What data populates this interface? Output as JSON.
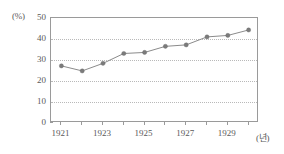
{
  "chart_data": {
    "type": "line",
    "title": "",
    "xlabel": "(년)",
    "ylabel": "(%)",
    "x": [
      1921,
      1922,
      1923,
      1924,
      1925,
      1926,
      1927,
      1928,
      1929,
      1930
    ],
    "values": [
      27.2,
      24.8,
      28.4,
      33.1,
      33.6,
      36.5,
      37.2,
      41.0,
      41.7,
      44.3
    ],
    "series": [
      {
        "name": "",
        "values": [
          27.2,
          24.8,
          28.4,
          33.1,
          33.6,
          36.5,
          37.2,
          41.0,
          41.7,
          44.3
        ]
      }
    ],
    "xlim": [
      1920.5,
      1930.5
    ],
    "ylim": [
      0,
      50
    ],
    "ytick_labels": [
      "50",
      "40",
      "30",
      "20",
      "10",
      "0"
    ],
    "ytick_values": [
      50,
      40,
      30,
      20,
      10,
      0
    ],
    "xtick_values": [
      1921,
      1922,
      1923,
      1924,
      1925,
      1926,
      1927,
      1928,
      1929,
      1930
    ],
    "xtick_labels": [
      "1921",
      "",
      "1923",
      "",
      "1925",
      "",
      "1927",
      "",
      "1929",
      ""
    ],
    "xtick_labels_shown": [
      "1921",
      "1923",
      "1925",
      "1927",
      "1929"
    ],
    "grid": "horizontal-dotted",
    "legend": "none",
    "line_color": "#8b8b8b",
    "marker_color": "#7b7b7b",
    "grid_color": "#b9b9b9",
    "frame_color": "#9a9a9a",
    "text_color": "#5a5a5a"
  }
}
